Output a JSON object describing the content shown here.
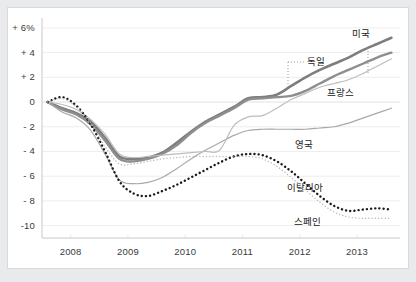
{
  "chart_data": {
    "type": "line",
    "title": "",
    "subtitle": "",
    "xlabel": "",
    "ylabel": "",
    "ylim": [
      -11,
      6.8
    ],
    "xlim": [
      2007.5,
      2013.75
    ],
    "grid": "horizontal-light",
    "legend_position": "inline-annotations",
    "y_ticks": [
      6,
      4,
      2,
      0,
      -2,
      -4,
      -6,
      -8,
      -10
    ],
    "y_tick_labels": [
      "+ 6%",
      "+ 4",
      "+ 2",
      "0",
      "- 2",
      "- 4",
      "- 6",
      "- 8",
      "-10"
    ],
    "x_ticks": [
      2008,
      2009,
      2010,
      2011,
      2012,
      2013
    ],
    "x_tick_labels": [
      "2008",
      "2009",
      "2010",
      "2011",
      "2012",
      "2013"
    ],
    "series": [
      {
        "name": "미국",
        "label": "미국",
        "style": "solid",
        "color": "#7d7d7d",
        "width": 2.6,
        "x": [
          2007.6,
          2007.85,
          2008.1,
          2008.35,
          2008.6,
          2008.85,
          2009.1,
          2009.35,
          2009.6,
          2009.85,
          2010.1,
          2010.35,
          2010.6,
          2010.85,
          2011.1,
          2011.35,
          2011.6,
          2011.85,
          2012.1,
          2012.35,
          2012.6,
          2012.85,
          2013.1,
          2013.35,
          2013.6
        ],
        "y": [
          0.0,
          -0.5,
          -0.9,
          -1.6,
          -2.9,
          -4.4,
          -4.6,
          -4.5,
          -4.1,
          -3.3,
          -2.4,
          -1.6,
          -1.0,
          -0.4,
          0.3,
          0.4,
          0.6,
          1.3,
          2.0,
          2.6,
          3.1,
          3.6,
          4.2,
          4.7,
          5.2
        ]
      },
      {
        "name": "독일",
        "label": "독일",
        "style": "solid",
        "color": "#8e8e8e",
        "width": 2.4,
        "x": [
          2007.6,
          2007.85,
          2008.1,
          2008.35,
          2008.6,
          2008.85,
          2009.1,
          2009.35,
          2009.6,
          2009.85,
          2010.1,
          2010.35,
          2010.6,
          2010.85,
          2011.1,
          2011.35,
          2011.6,
          2011.85,
          2012.1,
          2012.35,
          2012.6,
          2012.85,
          2013.1,
          2013.35,
          2013.6
        ],
        "y": [
          0.0,
          -0.6,
          -1.0,
          -1.8,
          -3.1,
          -4.6,
          -4.8,
          -4.6,
          -4.2,
          -3.5,
          -2.5,
          -1.7,
          -1.1,
          -0.5,
          0.2,
          0.3,
          0.4,
          0.5,
          0.9,
          1.5,
          2.1,
          2.6,
          3.1,
          3.6,
          4.0
        ]
      },
      {
        "name": "프랑스",
        "label": "프랑스",
        "style": "solid",
        "color": "#a9a9a9",
        "width": 1.2,
        "x": [
          2007.6,
          2007.85,
          2008.1,
          2008.35,
          2008.6,
          2008.85,
          2009.1,
          2009.35,
          2009.6,
          2009.85,
          2010.1,
          2010.35,
          2010.6,
          2010.85,
          2011.1,
          2011.35,
          2011.6,
          2011.85,
          2012.1,
          2012.35,
          2012.6,
          2012.85,
          2013.1,
          2013.35,
          2013.6
        ],
        "y": [
          0.0,
          -0.8,
          -1.3,
          -2.3,
          -4.2,
          -6.3,
          -6.6,
          -6.5,
          -6.1,
          -5.4,
          -4.6,
          -3.9,
          -3.3,
          -2.7,
          -2.3,
          -2.2,
          -2.2,
          -2.2,
          -2.2,
          -2.1,
          -2.0,
          -1.7,
          -1.3,
          -0.9,
          -0.5
        ]
      },
      {
        "name": "영국",
        "label": "영국",
        "style": "solid",
        "color": "#bdbdbd",
        "width": 1.2,
        "x": [
          2007.6,
          2007.85,
          2008.1,
          2008.35,
          2008.6,
          2008.85,
          2009.1,
          2009.35,
          2009.6,
          2009.85,
          2010.1,
          2010.35,
          2010.6,
          2010.85,
          2011.1,
          2011.35,
          2011.6,
          2011.85,
          2012.1,
          2012.35,
          2012.6,
          2012.85,
          2013.1,
          2013.35,
          2013.6
        ],
        "y": [
          0.0,
          -0.2,
          -0.6,
          -1.4,
          -2.6,
          -4.2,
          -4.5,
          -4.4,
          -4.3,
          -4.2,
          -4.1,
          -4.0,
          -3.9,
          -1.9,
          -1.2,
          -1.1,
          -0.5,
          0.2,
          0.7,
          1.2,
          1.5,
          1.8,
          2.3,
          2.9,
          3.5
        ]
      },
      {
        "name": "이탈리아",
        "label": "이탈리아",
        "style": "dotted-bold",
        "color": "#1a1a1a",
        "width": 2.4,
        "x": [
          2007.6,
          2007.85,
          2008.1,
          2008.35,
          2008.6,
          2008.85,
          2009.1,
          2009.35,
          2009.6,
          2009.85,
          2010.1,
          2010.35,
          2010.6,
          2010.85,
          2011.1,
          2011.35,
          2011.6,
          2011.85,
          2012.1,
          2012.35,
          2012.6,
          2012.85,
          2013.1,
          2013.35,
          2013.6
        ],
        "y": [
          0.0,
          0.4,
          -0.3,
          -1.8,
          -4.0,
          -6.4,
          -7.4,
          -7.6,
          -7.2,
          -6.7,
          -6.1,
          -5.5,
          -4.9,
          -4.4,
          -4.2,
          -4.3,
          -4.8,
          -5.6,
          -6.6,
          -7.6,
          -8.4,
          -8.8,
          -8.7,
          -8.6,
          -8.7
        ]
      },
      {
        "name": "스페인",
        "label": "스페인",
        "style": "dotted-fine",
        "color": "#b8b8b8",
        "width": 1.4,
        "x": [
          2007.6,
          2007.85,
          2008.1,
          2008.35,
          2008.6,
          2008.85,
          2009.1,
          2009.35,
          2009.6,
          2009.85,
          2010.1,
          2010.35,
          2010.6,
          2010.85,
          2011.1,
          2011.35,
          2011.6,
          2011.85,
          2012.1,
          2012.35,
          2012.6,
          2012.85,
          2013.1,
          2013.35,
          2013.6
        ],
        "y": [
          0.0,
          0.3,
          -0.4,
          -1.7,
          -3.6,
          -5.0,
          -5.0,
          -4.8,
          -4.6,
          -4.5,
          -4.4,
          -4.4,
          -4.4,
          -4.4,
          -4.4,
          -4.6,
          -5.2,
          -6.1,
          -7.1,
          -8.1,
          -8.9,
          -9.3,
          -9.4,
          -9.4,
          -9.4
        ]
      }
    ],
    "annotations": [
      {
        "name": "독일",
        "text": "독일",
        "leader": "horizontal-dotted-left-and-vertical-dotted-down"
      },
      {
        "name": "미국",
        "text": "미국",
        "leader": "vertical-dotted-down"
      },
      {
        "name": "프랑스",
        "text": "프랑스",
        "leader": "none"
      },
      {
        "name": "영국",
        "text": "영국",
        "leader": "none"
      },
      {
        "name": "이탈리아",
        "text": "이탈리아",
        "leader": "none"
      },
      {
        "name": "스페인",
        "text": "스페인",
        "leader": "none"
      }
    ]
  },
  "colors": {
    "page_background": "#e9eaeb",
    "card_background": "#ffffff",
    "card_border": "#d8d9da",
    "axis_line": "#c9c9c9",
    "gridline": "#ededed",
    "zero_line": "#e2e2e2",
    "tick_text": "#3a3a3a",
    "annotation_text": "#202020"
  }
}
